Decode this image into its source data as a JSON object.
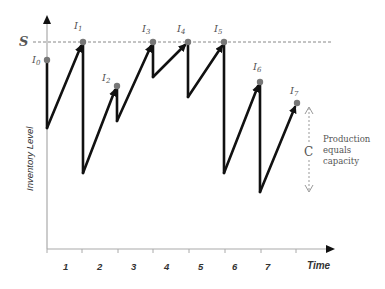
{
  "diagram": {
    "title": "",
    "y_axis_label": "Inventory Level",
    "x_axis_label": "Time",
    "s_label": "S",
    "c_label": "C",
    "annotation": [
      "Production",
      "equals",
      "capacity"
    ],
    "period_labels": [
      "1",
      "2",
      "3",
      "4",
      "5",
      "6",
      "7"
    ],
    "points": [
      {
        "label": "I0",
        "sub": "0"
      },
      {
        "label": "I1",
        "sub": "1"
      },
      {
        "label": "I2",
        "sub": "2"
      },
      {
        "label": "I3",
        "sub": "3"
      },
      {
        "label": "I4",
        "sub": "4"
      },
      {
        "label": "I5",
        "sub": "5"
      },
      {
        "label": "I6",
        "sub": "6"
      },
      {
        "label": "I7",
        "sub": "7"
      }
    ],
    "colors": {
      "line": "#111111",
      "axis": "#aaaaaa",
      "dot": "#777777",
      "dashed": "#888888",
      "text": "#555555"
    }
  }
}
